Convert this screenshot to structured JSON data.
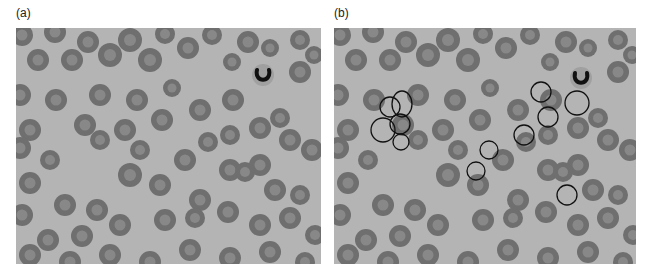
{
  "figure": {
    "panels": [
      {
        "id": "a",
        "label": "(a)",
        "description": "Blood smear, unannotated"
      },
      {
        "id": "b",
        "label": "(b)",
        "description": "Same blood smear with selected cells circled"
      }
    ],
    "colors": {
      "background": "#b4b4b4",
      "cell_rim": "#6f6f6f",
      "cell_center": "#8f8f8f",
      "nucleus": "#111111",
      "annotation": "#111111"
    },
    "cells": [
      [
        22,
        35,
        11
      ],
      [
        55,
        32,
        11
      ],
      [
        88,
        42,
        11
      ],
      [
        130,
        40,
        12
      ],
      [
        165,
        34,
        10
      ],
      [
        212,
        35,
        10
      ],
      [
        248,
        42,
        11
      ],
      [
        300,
        40,
        10
      ],
      [
        38,
        60,
        11
      ],
      [
        72,
        60,
        11
      ],
      [
        110,
        55,
        12
      ],
      [
        150,
        60,
        12
      ],
      [
        188,
        48,
        11
      ],
      [
        232,
        62,
        9
      ],
      [
        270,
        48,
        9
      ],
      [
        314,
        55,
        9
      ],
      [
        20,
        95,
        11
      ],
      [
        56,
        100,
        11
      ],
      [
        100,
        95,
        11
      ],
      [
        137,
        100,
        11
      ],
      [
        172,
        88,
        9
      ],
      [
        200,
        110,
        11
      ],
      [
        233,
        100,
        11
      ],
      [
        300,
        72,
        11
      ],
      [
        30,
        130,
        11
      ],
      [
        85,
        125,
        11
      ],
      [
        125,
        130,
        11
      ],
      [
        162,
        120,
        11
      ],
      [
        185,
        160,
        11
      ],
      [
        208,
        142,
        10
      ],
      [
        230,
        135,
        10
      ],
      [
        260,
        128,
        11
      ],
      [
        290,
        140,
        11
      ],
      [
        20,
        148,
        11
      ],
      [
        50,
        160,
        10
      ],
      [
        100,
        140,
        10
      ],
      [
        140,
        150,
        10
      ],
      [
        280,
        118,
        10
      ],
      [
        230,
        170,
        11
      ],
      [
        260,
        165,
        11
      ],
      [
        312,
        150,
        11
      ],
      [
        30,
        183,
        11
      ],
      [
        65,
        205,
        11
      ],
      [
        97,
        210,
        11
      ],
      [
        130,
        175,
        12
      ],
      [
        160,
        185,
        11
      ],
      [
        200,
        200,
        11
      ],
      [
        245,
        172,
        10
      ],
      [
        275,
        190,
        11
      ],
      [
        300,
        195,
        10
      ],
      [
        22,
        215,
        11
      ],
      [
        48,
        240,
        11
      ],
      [
        82,
        236,
        11
      ],
      [
        120,
        225,
        11
      ],
      [
        165,
        220,
        11
      ],
      [
        195,
        218,
        10
      ],
      [
        228,
        212,
        11
      ],
      [
        260,
        225,
        11
      ],
      [
        290,
        218,
        11
      ],
      [
        315,
        235,
        10
      ],
      [
        30,
        255,
        11
      ],
      [
        70,
        262,
        11
      ],
      [
        110,
        255,
        11
      ],
      [
        150,
        262,
        11
      ],
      [
        190,
        250,
        11
      ],
      [
        230,
        258,
        11
      ],
      [
        270,
        252,
        11
      ],
      [
        305,
        262,
        10
      ]
    ],
    "neutrophil": {
      "a": [
        263,
        75
      ],
      "b": [
        581,
        78
      ]
    },
    "annotations_b": [
      {
        "cx": 390,
        "cy": 107,
        "rx": 10,
        "ry": 10
      },
      {
        "cx": 402,
        "cy": 104,
        "rx": 10,
        "ry": 13
      },
      {
        "cx": 383,
        "cy": 130,
        "rx": 12,
        "ry": 12
      },
      {
        "cx": 400,
        "cy": 124,
        "rx": 10,
        "ry": 10
      },
      {
        "cx": 401,
        "cy": 142,
        "rx": 8,
        "ry": 8
      },
      {
        "cx": 476,
        "cy": 171,
        "rx": 9,
        "ry": 9
      },
      {
        "cx": 489,
        "cy": 150,
        "rx": 9,
        "ry": 9
      },
      {
        "cx": 524,
        "cy": 135,
        "rx": 10,
        "ry": 10
      },
      {
        "cx": 541,
        "cy": 92,
        "rx": 10,
        "ry": 10
      },
      {
        "cx": 548,
        "cy": 117,
        "rx": 10,
        "ry": 10
      },
      {
        "cx": 577,
        "cy": 103,
        "rx": 12,
        "ry": 12
      },
      {
        "cx": 567,
        "cy": 195,
        "rx": 10,
        "ry": 10
      }
    ]
  }
}
